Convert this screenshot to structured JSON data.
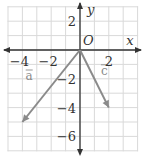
{
  "figure": {
    "type": "coordinate-plane-vectors",
    "axes": {
      "x_label": "x",
      "y_label": "y",
      "origin_label": "O",
      "x_ticks": [
        {
          "value": -4,
          "label": "−4"
        },
        {
          "value": -2,
          "label": "−2"
        },
        {
          "value": 2,
          "label": "2"
        }
      ],
      "y_ticks": [
        {
          "value": 2,
          "label": "2"
        },
        {
          "value": -2,
          "label": "−2"
        },
        {
          "value": -4,
          "label": "−4"
        },
        {
          "value": -6,
          "label": "−6"
        }
      ],
      "x_range": [
        -5,
        4
      ],
      "y_range": [
        -7,
        3
      ]
    },
    "vectors": [
      {
        "name": "a",
        "label": "a",
        "from": [
          0,
          0
        ],
        "to": [
          -4,
          -5
        ]
      },
      {
        "name": "c",
        "label": "c",
        "from": [
          0,
          0
        ],
        "to": [
          2,
          -4
        ]
      }
    ],
    "colors": {
      "grid": "#d9d9d9",
      "axis": "#333333",
      "vector": "#8a8a8a",
      "text": "#333333"
    }
  }
}
